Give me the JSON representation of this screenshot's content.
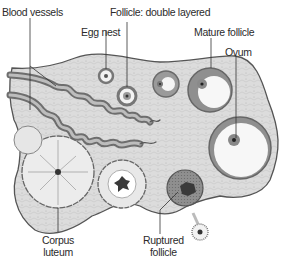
{
  "diagram": {
    "labels": {
      "blood_vessels": "Blood vessels",
      "egg_nest": "Egg nest",
      "follicle_double_layered": "Follicle: double layered",
      "mature_follicle": "Mature follicle",
      "ovum": "Ovum",
      "corpus_luteum_line1": "Corpus",
      "corpus_luteum_line2": "luteum",
      "ruptured_follicle_line1": "Ruptured",
      "ruptured_follicle_line2": "follicle"
    },
    "colors": {
      "stroma": "#d9d9d9",
      "outline": "#555555",
      "vessel_dark": "#6e6e6e",
      "vessel_light": "#bdbdbd",
      "follicle_wall": "#8a8a8a",
      "antrum": "#f7f7f7",
      "dark_core": "#3a3a3a",
      "leader_line": "#333333"
    }
  }
}
